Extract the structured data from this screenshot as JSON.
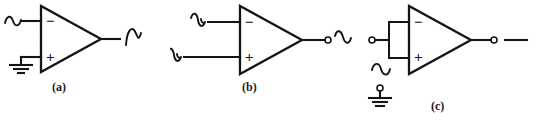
{
  "figure": {
    "type": "schematic-figure",
    "background_color": "#ffffff",
    "line_color": "#141414",
    "width": 536,
    "height": 134
  },
  "panels": [
    {
      "id": "a",
      "caption": "(a)",
      "amplifier": {
        "name": "op-amp-triangle",
        "inverting_label": "−",
        "noninverting_label": "+"
      },
      "inputs": [
        {
          "terminal": "inverting",
          "signal": "sine-wave",
          "icon": "sine-wave-icon"
        },
        {
          "terminal": "noninverting",
          "signal": "ground",
          "icon": "ground-icon"
        }
      ],
      "output": {
        "signal": "sine-wave",
        "icon": "sine-wave-icon",
        "terminal_dot": false
      }
    },
    {
      "id": "b",
      "caption": "(b)",
      "amplifier": {
        "name": "op-amp-triangle",
        "inverting_label": "−",
        "noninverting_label": "+"
      },
      "inputs": [
        {
          "terminal": "inverting",
          "signal": "sine-wave",
          "icon": "sine-wave-icon"
        },
        {
          "terminal": "noninverting",
          "signal": "sine-wave",
          "icon": "sine-wave-icon"
        }
      ],
      "output": {
        "signal": "sine-wave",
        "icon": "sine-wave-icon",
        "terminal_dot": true
      }
    },
    {
      "id": "c",
      "caption": "(c)",
      "amplifier": {
        "name": "op-amp-triangle",
        "inverting_label": "−",
        "noninverting_label": "+"
      },
      "components": [
        {
          "name": "input-resistor-box",
          "type": "rectangle-element"
        }
      ],
      "inputs": [
        {
          "terminal": "differential-left",
          "signal": "terminal-node",
          "icon": "open-terminal-icon"
        },
        {
          "terminal": "source",
          "signal": "sine-wave",
          "icon": "sine-wave-icon"
        },
        {
          "terminal": "reference",
          "signal": "ground",
          "icon": "ground-icon-with-node"
        }
      ],
      "output": {
        "signal": "dc-level",
        "icon": "straight-line-icon",
        "terminal_dot": true
      }
    }
  ]
}
